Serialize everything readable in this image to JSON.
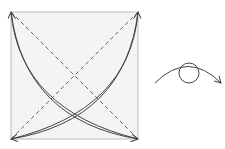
{
  "diagram": {
    "colors": {
      "paper_fill": "#f4f4f4",
      "paper_border": "#bbbbbb",
      "line": "#444444",
      "dash": "#555555"
    },
    "square": {
      "x": 11,
      "y": 12,
      "size": 127
    },
    "symbols": {
      "fold_lines": "diagonal-dashed-lines",
      "arrows": "curved-corner-arrows",
      "turn_over": "turn-over-symbol"
    }
  }
}
